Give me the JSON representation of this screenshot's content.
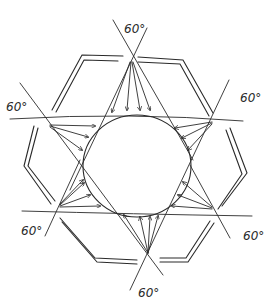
{
  "diagram": {
    "type": "hand-drawn sketch",
    "labels": [
      {
        "id": "top",
        "text": "60°"
      },
      {
        "id": "upper-left",
        "text": "60°"
      },
      {
        "id": "upper-right",
        "text": "60°"
      },
      {
        "id": "lower-left",
        "text": "60°"
      },
      {
        "id": "lower-right",
        "text": "60°"
      },
      {
        "id": "bottom",
        "text": "60°"
      }
    ],
    "colors": {
      "ink": "#2a2a2a",
      "background": "#ffffff"
    }
  }
}
